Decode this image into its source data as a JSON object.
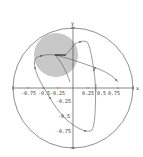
{
  "diagram": {
    "type": "phase-plot-unit-disk",
    "axis_labels": {
      "x": "x",
      "y": "y"
    },
    "x_ticks": [
      "-0.75",
      "-0.5",
      "-0.25",
      "0.25",
      "0.5",
      "0.75"
    ],
    "y_ticks": [
      "-0.25",
      "-0.5",
      "-0.75"
    ],
    "colors": {
      "disk_fill": "#c8c8c8",
      "line": "#555555",
      "axis": "#333333",
      "background": "#ffffff"
    },
    "unit_circle": {
      "cx": 73,
      "cy": 88,
      "r": 60
    },
    "gray_disk": {
      "cx": 56,
      "cy": 55,
      "r": 22
    }
  }
}
